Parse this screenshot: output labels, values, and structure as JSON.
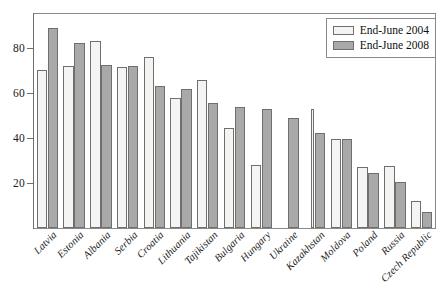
{
  "chart_data": {
    "type": "bar",
    "title": "",
    "subtitle": "",
    "xlabel": "",
    "ylabel": "",
    "ylim": [
      0,
      95
    ],
    "yticks": [
      20,
      40,
      60,
      80
    ],
    "grid": false,
    "legend_position": "top-right",
    "categories": [
      "Latvia",
      "Estonia",
      "Albania",
      "Serbia",
      "Croatia",
      "Lithuania",
      "Tajikistan",
      "Bulgaria",
      "Hungary",
      "Ukraine",
      "Kazakhstan",
      "Moldova",
      "Poland",
      "Russia",
      "Czech Republic"
    ],
    "series": [
      {
        "name": "End-June 2004",
        "color": "#f4f4f2",
        "values": [
          70,
          72,
          83,
          71.5,
          76,
          57.5,
          65.5,
          44.5,
          28,
          null,
          53,
          39.5,
          27,
          27.5,
          12
        ]
      },
      {
        "name": "End-June 2008",
        "color": "#a9a9a9",
        "values": [
          89,
          82,
          72.5,
          72,
          63,
          61.5,
          55.5,
          53.5,
          53,
          49,
          42,
          39.5,
          24.5,
          20.5,
          7
        ]
      }
    ]
  },
  "legend": {
    "items": [
      {
        "label": "End-June 2004",
        "swatch": "s2004"
      },
      {
        "label": "End-June 2008",
        "swatch": "s2008"
      }
    ]
  },
  "colors": {
    "series_2004": "#f4f4f2",
    "series_2008": "#a9a9a9",
    "axis": "#6e6e6e",
    "frame": "#8a8a8a",
    "text": "#1a1a1a",
    "background": "#ffffff"
  }
}
